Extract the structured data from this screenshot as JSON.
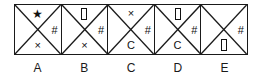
{
  "figure": {
    "type": "symbol-grid-strip",
    "cell_count": 5,
    "regions": [
      "top",
      "right",
      "bottom",
      "left"
    ],
    "stroke_color": "#1a1a1a",
    "symbol_color": "#111111",
    "background": "#ffffff"
  },
  "cells": [
    {
      "label": "A",
      "top": "★",
      "top_icon": "star-icon",
      "right": "#",
      "right_icon": "hash-icon",
      "bottom": "×",
      "bottom_icon": "cross-icon",
      "left": "",
      "left_icon": "empty"
    },
    {
      "label": "B",
      "top": "",
      "top_icon": "tofu-box-icon",
      "right": "#",
      "right_icon": "hash-icon",
      "bottom": "×",
      "bottom_icon": "cross-icon",
      "left": "",
      "left_icon": "empty"
    },
    {
      "label": "C",
      "top": "×",
      "top_icon": "cross-icon",
      "right": "#",
      "right_icon": "hash-icon",
      "bottom": "C",
      "bottom_icon": "letter-c",
      "left": "",
      "left_icon": "empty"
    },
    {
      "label": "D",
      "top": "",
      "top_icon": "tofu-box-icon",
      "right": "#",
      "right_icon": "hash-icon",
      "bottom": "C",
      "bottom_icon": "letter-c",
      "left": "",
      "left_icon": "empty"
    },
    {
      "label": "E",
      "top": "",
      "top_icon": "empty",
      "right": "#",
      "right_icon": "hash-icon",
      "bottom": "",
      "bottom_icon": "tofu-box-icon",
      "left": "",
      "left_icon": "empty"
    }
  ],
  "labels": [
    "A",
    "B",
    "C",
    "D",
    "E"
  ]
}
